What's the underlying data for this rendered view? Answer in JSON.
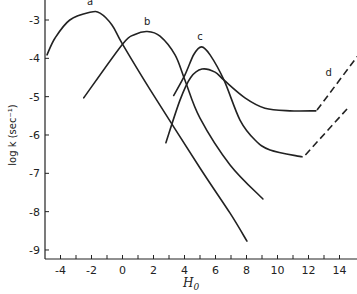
{
  "chart_data": {
    "type": "line",
    "title": "",
    "xlabel": "H0",
    "ylabel": "log k (sec⁻¹)",
    "xlim": [
      -5,
      15.2
    ],
    "ylim": [
      -9.25,
      -2.5
    ],
    "xticks": [
      -4,
      -3,
      -2,
      -1,
      0,
      1,
      2,
      3,
      4,
      5,
      6,
      7,
      8,
      9,
      10,
      11,
      12,
      13,
      14
    ],
    "xtick_labels": [
      "-4",
      "-2",
      "0",
      "2",
      "4",
      "6",
      "8",
      "10",
      "12",
      "14"
    ],
    "xtick_label_values": [
      -4,
      -2,
      0,
      2,
      4,
      6,
      8,
      10,
      12,
      14
    ],
    "yticks": [
      -3,
      -4,
      -5,
      -6,
      -7,
      -8,
      -9
    ],
    "ytick_labels": [
      "-3",
      "-4",
      "-5",
      "-6",
      "-7",
      "-8",
      "-9"
    ],
    "grid": false,
    "legend": "none",
    "series": [
      {
        "name": "a",
        "style": "solid",
        "label_at": [
          -2.1,
          -2.62
        ],
        "points": [
          [
            -4.87,
            -3.91
          ],
          [
            -4.35,
            -3.47
          ],
          [
            -3.4,
            -3.0
          ],
          [
            -2.1,
            -2.8
          ],
          [
            -1.45,
            -2.82
          ],
          [
            -0.68,
            -3.13
          ],
          [
            0,
            -3.63
          ],
          [
            1.8,
            -4.83
          ],
          [
            5.0,
            -6.86
          ],
          [
            6.94,
            -8.04
          ],
          [
            8.03,
            -8.77
          ]
        ]
      },
      {
        "name": "b",
        "style": "solid",
        "label_at": [
          1.6,
          -3.12
        ],
        "points": [
          [
            -2.5,
            -5.03
          ],
          [
            0,
            -3.63
          ],
          [
            0.8,
            -3.38
          ],
          [
            1.6,
            -3.3
          ],
          [
            2.42,
            -3.42
          ],
          [
            3.39,
            -3.91
          ],
          [
            4.03,
            -4.57
          ],
          [
            5.0,
            -5.56
          ],
          [
            6.94,
            -6.78
          ],
          [
            9.06,
            -7.67
          ]
        ]
      },
      {
        "name": "c",
        "style": "solid",
        "label_at": [
          5.0,
          -3.52
        ],
        "points": [
          [
            3.3,
            -4.97
          ],
          [
            4.03,
            -4.43
          ],
          [
            4.6,
            -3.9
          ],
          [
            5.1,
            -3.7
          ],
          [
            5.65,
            -3.91
          ],
          [
            6.55,
            -4.57
          ],
          [
            7.58,
            -5.61
          ],
          [
            8.55,
            -6.13
          ],
          [
            9.52,
            -6.39
          ],
          [
            11.58,
            -6.57
          ]
        ]
      },
      {
        "name": "c-extension",
        "style": "dashed",
        "points": [
          [
            11.8,
            -6.52
          ],
          [
            14.6,
            -5.27
          ]
        ]
      },
      {
        "name": "d",
        "style": "solid",
        "points": [
          [
            2.8,
            -6.2
          ],
          [
            3.71,
            -5.09
          ],
          [
            4.4,
            -4.5
          ],
          [
            5.13,
            -4.28
          ],
          [
            5.97,
            -4.36
          ],
          [
            6.55,
            -4.57
          ],
          [
            7.9,
            -5.03
          ],
          [
            9.19,
            -5.3
          ],
          [
            10.8,
            -5.37
          ],
          [
            12.48,
            -5.37
          ]
        ]
      },
      {
        "name": "d-extension",
        "style": "dashed",
        "label_at": [
          13.3,
          -4.45
        ],
        "label": "d",
        "points": [
          [
            12.55,
            -5.35
          ],
          [
            15.15,
            -3.95
          ]
        ]
      }
    ]
  }
}
